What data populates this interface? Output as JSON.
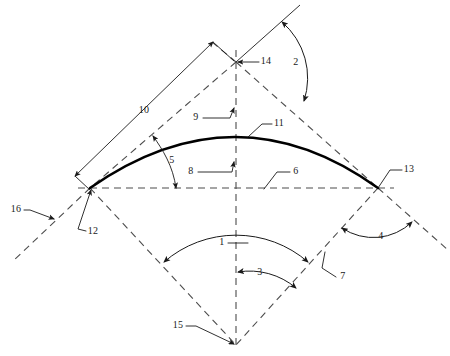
{
  "figure": {
    "background_color": "#ffffff",
    "line_color_solid": "#1a1a1a",
    "line_color_dashed": "#4c4c4c",
    "arc_color": "#000000",
    "width": 450,
    "height": 356
  },
  "reference_numerals": [
    {
      "id": "1",
      "label": "1",
      "x": 222,
      "y": 243,
      "role": "included-angle-full",
      "description": "large angle arc spanning both lower rhombus edges from bottom vertex"
    },
    {
      "id": "2",
      "label": "2",
      "x": 296,
      "y": 63,
      "role": "angle-upper-right",
      "description": "angle arc between upper solid ray and upper-right dashed edge"
    },
    {
      "id": "3",
      "label": "3",
      "x": 260,
      "y": 273,
      "role": "half-angle",
      "description": "angle arc from vertical centre axis to lower-right dashed edge"
    },
    {
      "id": "4",
      "label": "4",
      "x": 381,
      "y": 237,
      "role": "angle-lower-right-exterior",
      "description": "angle arc between lower-right edge and its extension"
    },
    {
      "id": "5",
      "label": "5",
      "x": 172,
      "y": 161,
      "role": "rise-dimension",
      "description": "double arrow leader from upper-left dashed edge to chord line"
    },
    {
      "id": "6",
      "label": "6",
      "x": 283,
      "y": 178,
      "role": "chord-line",
      "description": "horizontal dashed chord / span line"
    },
    {
      "id": "7",
      "label": "7",
      "x": 348,
      "y": 277,
      "role": "lower-right-edge",
      "description": "leader to lower-right dashed edge"
    },
    {
      "id": "8",
      "label": "8",
      "x": 189,
      "y": 176,
      "role": "half-span",
      "description": "leader pointing to vertical centre axis below arc"
    },
    {
      "id": "9",
      "label": "9",
      "x": 194,
      "y": 117,
      "role": "upper-axis",
      "description": "leader pointing to vertical centre axis above arc"
    },
    {
      "id": "10",
      "label": "10",
      "x": 144,
      "y": 111,
      "role": "edge-length-dimension",
      "description": "dimension line parallel to upper-left dashed edge with arrowheads"
    },
    {
      "id": "11",
      "label": "11",
      "x": 278,
      "y": 129,
      "role": "arch-member",
      "description": "leader to the heavy curved arch member"
    },
    {
      "id": "12",
      "label": "12",
      "x": 92,
      "y": 236,
      "role": "left-vertex",
      "description": "leader to left vertex / left springing point"
    },
    {
      "id": "13",
      "label": "13",
      "x": 408,
      "y": 176,
      "role": "right-vertex",
      "description": "leader to right vertex / right springing point"
    },
    {
      "id": "14",
      "label": "14",
      "x": 265,
      "y": 61,
      "role": "top-vertex",
      "description": "arrow to top vertex of rhombus"
    },
    {
      "id": "15",
      "label": "15",
      "x": 177,
      "y": 330,
      "role": "bottom-vertex",
      "description": "leader to bottom vertex / centre of curvature"
    },
    {
      "id": "16",
      "label": "16",
      "x": 16,
      "y": 208,
      "role": "edge-extension",
      "description": "leader to lower-left dashed extension line"
    }
  ],
  "geometry": {
    "vertices": {
      "top": {
        "name": "top-vertex",
        "x": 236,
        "y": 62,
        "numeral": "14"
      },
      "left": {
        "name": "left-vertex",
        "x": 90,
        "y": 188,
        "numeral": "12"
      },
      "right": {
        "name": "right-vertex",
        "x": 378,
        "y": 188,
        "numeral": "13"
      },
      "bottom": {
        "name": "bottom-vertex",
        "x": 236,
        "y": 345,
        "numeral": "15"
      }
    },
    "arc": {
      "name": "arch-member",
      "start": {
        "x": 90,
        "y": 188
      },
      "end": {
        "x": 378,
        "y": 188
      },
      "apex": {
        "x": 236,
        "y": 137
      },
      "numeral": "11",
      "stroke_width": 2.6
    },
    "chord": {
      "name": "chord-line",
      "x1": 80,
      "y1": 188,
      "x2": 392,
      "y2": 188,
      "numeral": "6"
    },
    "axis": {
      "name": "vertical-axis",
      "x1": 236,
      "y1": 52,
      "x2": 236,
      "y2": 345,
      "numerals": [
        "9",
        "8"
      ]
    },
    "extensions": {
      "lower_left": {
        "name": "lower-left-extension",
        "x1": 90,
        "y1": 188,
        "x2": 12,
        "y2": 262,
        "numeral": "16"
      },
      "lower_right": {
        "name": "lower-right-extension",
        "x1": 378,
        "y1": 188,
        "x2": 448,
        "y2": 250,
        "numeral": "4"
      },
      "upper_right": {
        "name": "upper-right-solid-ray",
        "x1": 236,
        "y1": 62,
        "x2": 298,
        "y2": 6
      }
    },
    "dimension_10": {
      "name": "edge-length-dimension",
      "x1": 76,
      "y1": 175,
      "x2": 212,
      "y2": 43,
      "numeral": "10"
    }
  }
}
